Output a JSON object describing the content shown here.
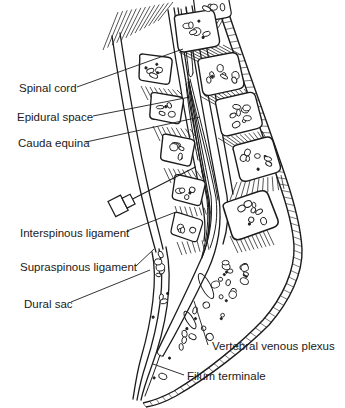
{
  "figure": {
    "kind": "anatomical-line-diagram",
    "colors": {
      "ink": "#1c1c1c",
      "background": "#ffffff",
      "text": "#1a1a1a"
    }
  },
  "labels": [
    {
      "text": "Spinal cord",
      "side": "left"
    },
    {
      "text": "Epidural space",
      "side": "left"
    },
    {
      "text": "Cauda equina",
      "side": "left"
    },
    {
      "text": "Interspinous ligament",
      "side": "left"
    },
    {
      "text": "Supraspinous ligament",
      "side": "left"
    },
    {
      "text": "Dural sac",
      "side": "left"
    },
    {
      "text": "Vertebral venous plexus",
      "side": "right"
    },
    {
      "text": "Filum terminale",
      "side": "right"
    }
  ],
  "icons": [
    {
      "name": "epidural-needle-icon"
    }
  ]
}
